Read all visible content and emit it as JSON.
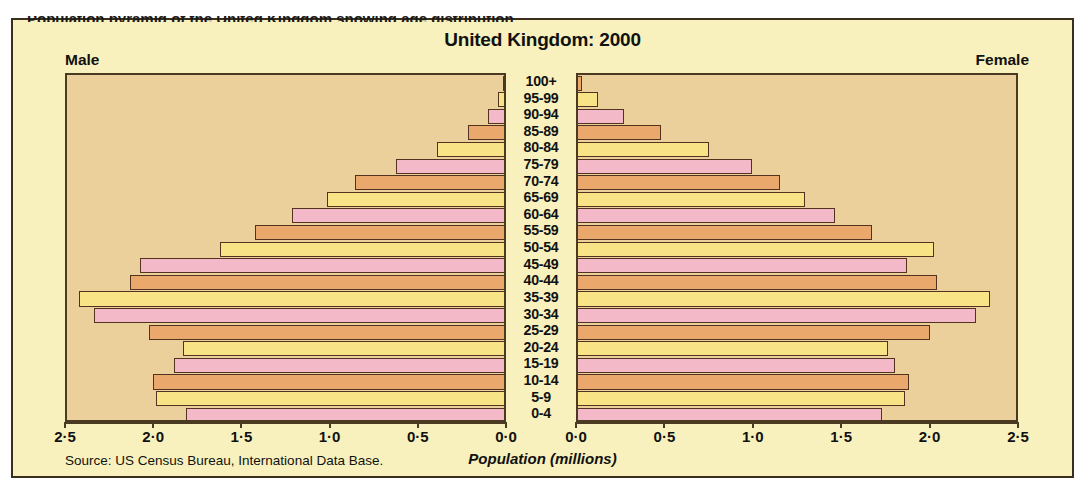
{
  "figure": {
    "cut_off_header_text": "Population pyramid of the United Kingdom showing age distribution",
    "title": "United Kingdom: 2000",
    "left_side_label": "Male",
    "right_side_label": "Female",
    "axis_title": "Population (millions)",
    "source_note": "Source: US Census Bureau, International Data Base.",
    "tick_labels": [
      "2·5",
      "2·0",
      "1·5",
      "1·0",
      "0·5",
      "0·0"
    ],
    "colors": {
      "page_background": "#ffffff",
      "frame_background": "#f8f1bd",
      "plot_background": "#ecd09b",
      "frame_border": "#3a2f1c",
      "bar_border": "#51331f",
      "bar_pink": "#f3b9c8",
      "bar_yellow": "#f8e487",
      "bar_orange": "#eaa86d",
      "text": "#111111"
    }
  },
  "chart_data": {
    "type": "bar",
    "subtype": "population-pyramid",
    "title": "United Kingdom: 2000",
    "xlabel": "Population (millions)",
    "ylabel": "",
    "xlim": [
      0,
      2.5
    ],
    "xticks": [
      2.5,
      2.0,
      1.5,
      1.0,
      0.5,
      0.0
    ],
    "xtick_labels": [
      "2·5",
      "2·0",
      "1·5",
      "1·0",
      "0·5",
      "0·0"
    ],
    "grid": false,
    "legend": "none",
    "source": "US Census Bureau, International Data Base.",
    "categories": [
      "100+",
      "95-99",
      "90-94",
      "85-89",
      "80-84",
      "75-79",
      "70-74",
      "65-69",
      "60-64",
      "55-59",
      "50-54",
      "45-49",
      "40-44",
      "35-39",
      "30-34",
      "25-29",
      "20-24",
      "15-19",
      "10-14",
      "5-9",
      "0-4"
    ],
    "series": [
      {
        "name": "Male",
        "side": "left",
        "values": [
          0.01,
          0.04,
          0.1,
          0.21,
          0.39,
          0.62,
          0.85,
          1.01,
          1.21,
          1.42,
          1.62,
          2.07,
          2.13,
          2.42,
          2.33,
          2.02,
          1.83,
          1.88,
          2.0,
          1.98,
          1.81
        ]
      },
      {
        "name": "Female",
        "side": "right",
        "values": [
          0.03,
          0.12,
          0.27,
          0.48,
          0.75,
          0.99,
          1.15,
          1.29,
          1.46,
          1.67,
          2.02,
          1.87,
          2.04,
          2.34,
          2.26,
          2.0,
          1.76,
          1.8,
          1.88,
          1.86,
          1.73
        ]
      }
    ],
    "bar_color_cycle": [
      "pink",
      "yellow",
      "orange"
    ],
    "bar_color_cycle_note": "Colors cycle from the bottom row (0-4 = pink) upward."
  }
}
